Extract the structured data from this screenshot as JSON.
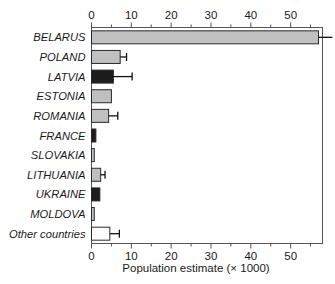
{
  "chart_data": {
    "type": "bar",
    "orientation": "horizontal",
    "title": "",
    "subtitle": "",
    "xlabel": "Population estimate (× 1000)",
    "ylabel": "",
    "xlim": [
      0,
      58
    ],
    "ylim": null,
    "grid": false,
    "legend": null,
    "x_ticks": [
      0,
      10,
      20,
      30,
      40,
      50
    ],
    "x_tick_labels": [
      "0",
      "10",
      "20",
      "30",
      "40",
      "50"
    ],
    "x_minor_tick_step": 5,
    "axes_top_ticks": true,
    "axes_bottom_ticks": true,
    "categories": [
      "BELARUS",
      "POLAND",
      "LATVIA",
      "ESTONIA",
      "ROMANIA",
      "FRANCE",
      "SLOVAKIA",
      "LITHUANIA",
      "UKRAINE",
      "MOLDOVA",
      "Other countries"
    ],
    "values": [
      57.0,
      7.2,
      5.5,
      5.0,
      4.3,
      1.1,
      0.7,
      2.3,
      2.1,
      0.7,
      4.6
    ],
    "error_upper": [
      60.5,
      8.8,
      10.2,
      null,
      6.6,
      null,
      null,
      3.4,
      null,
      null,
      7.0
    ],
    "bar_fills": [
      "#c0c0c0",
      "#c0c0c0",
      "#1c1c1c",
      "#c0c0c0",
      "#c0c0c0",
      "#1c1c1c",
      "#c0c0c0",
      "#c0c0c0",
      "#1c1c1c",
      "#c0c0c0",
      "#ffffff"
    ],
    "colors": {
      "gray_fill": "#c0c0c0",
      "black_fill": "#1c1c1c",
      "white_fill": "#ffffff",
      "outline": "#2a2a2a",
      "axis": "#555555",
      "text": "#1a1a1a",
      "background": "#ffffff"
    }
  }
}
